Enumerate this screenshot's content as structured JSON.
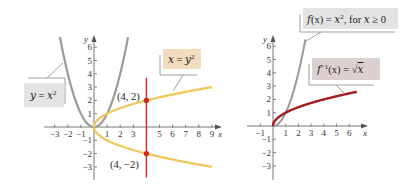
{
  "colors": {
    "parabola": "#9a9a9e",
    "sideways_parabola": "#f1c75a",
    "vertical_line": "#d8261c",
    "points": "#d8261c",
    "sqrt_curve": "#a51c1c",
    "label_bg_gray": "#e3e3e3",
    "label_bg_tan": "#f2dcc0",
    "label_bg_rose": "#dcd0d0",
    "axis": "#555555"
  },
  "chart_data": [
    {
      "type": "line",
      "title": "",
      "xlabel": "x",
      "ylabel": "y",
      "xlim": [
        -3.5,
        9.5
      ],
      "ylim": [
        -3.5,
        6.8
      ],
      "x_ticks": [
        -3,
        -2,
        -1,
        1,
        2,
        3,
        5,
        6,
        7,
        8,
        9
      ],
      "y_ticks": [
        -3,
        -2,
        -1,
        1,
        2,
        3,
        4,
        5,
        6
      ],
      "grid": false,
      "series": [
        {
          "name": "y = x²",
          "equation": "y = x^2",
          "x_range": [
            -2.6,
            2.6
          ],
          "color": "#9a9a9e"
        },
        {
          "name": "x = y²",
          "equation": "x = y^2",
          "y_range": [
            -3,
            3
          ],
          "color": "#f1c75a"
        },
        {
          "name": "x = 4",
          "equation": "x = 4",
          "y_range": [
            -3.8,
            3.7
          ],
          "color": "#d8261c"
        }
      ],
      "points": [
        {
          "x": 4,
          "y": 2,
          "label": "(4, 2)"
        },
        {
          "x": 4,
          "y": -2,
          "label": "(4, −2)"
        }
      ],
      "annotations": [
        "y = x²",
        "x = y²",
        "(4, 2)",
        "(4, −2)"
      ]
    },
    {
      "type": "line",
      "title": "",
      "xlabel": "x",
      "ylabel": "y",
      "xlim": [
        -1.5,
        7
      ],
      "ylim": [
        -3.5,
        6.8
      ],
      "x_ticks": [
        -1,
        1,
        2,
        3,
        4,
        5,
        6
      ],
      "y_ticks": [
        -3,
        -2,
        -1,
        1,
        2,
        3,
        4,
        5,
        6
      ],
      "grid": false,
      "series": [
        {
          "name": "f(x) = x², for x ≥ 0",
          "equation": "y = x^2",
          "x_range": [
            0,
            2.55
          ],
          "color": "#9a9a9e"
        },
        {
          "name": "f⁻¹(x) = √x",
          "equation": "y = sqrt(x)",
          "x_range": [
            0,
            6.6
          ],
          "color": "#a51c1c"
        }
      ],
      "annotations": [
        "f(x) = x², for x ≥ 0",
        "f⁻¹(x) = √x"
      ]
    }
  ],
  "left_graph": {
    "axis_x_label": "x",
    "axis_y_label": "y",
    "label_parabola": {
      "lhs": "y",
      "eq": " = ",
      "base": "x",
      "sup": "2"
    },
    "label_sideways": {
      "lhs": "x",
      "eq": " = ",
      "base": "y",
      "sup": "2"
    },
    "point_upper_label": "(4, 2)",
    "point_lower_label": "(4, −2)"
  },
  "right_graph": {
    "axis_x_label": "x",
    "axis_y_label": "y",
    "label_function": {
      "name": "f",
      "arg": "(x)",
      "eq": " = ",
      "base": "x",
      "sup": "2",
      "rest": ", for ",
      "var": "x",
      "cond": " ≥ 0"
    },
    "label_inverse": {
      "name": "f",
      "sup": "−1",
      "arg": "(x)",
      "eq": " = ",
      "rad": "√",
      "var": "x"
    }
  }
}
